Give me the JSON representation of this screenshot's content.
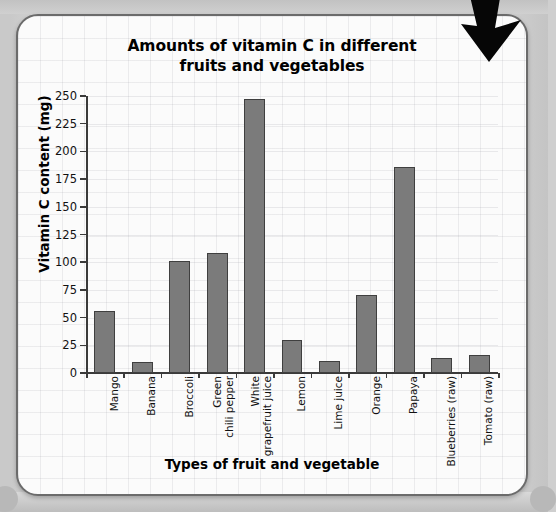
{
  "card": {
    "arrow_icon": "arrow-down-right-icon"
  },
  "chart_data": {
    "type": "bar",
    "title": "Amounts of vitamin C in different fruits and vegetables",
    "title_line1": "Amounts of vitamin C in different",
    "title_line2": "fruits and vegetables",
    "xlabel": "Types of fruit and vegetable",
    "ylabel": "Vitamin C content (mg)",
    "ylim": [
      0,
      250
    ],
    "ytick_step": 25,
    "yticks": [
      0,
      25,
      50,
      75,
      100,
      125,
      150,
      175,
      200,
      225,
      250
    ],
    "ytick_labels": [
      "0",
      "25",
      "50",
      "75",
      "100",
      "125",
      "150",
      "175",
      "200",
      "225",
      "250"
    ],
    "grid": true,
    "legend": "none",
    "bar_color": "#7b7b7b",
    "bar_edge_color": "#3f3f3f",
    "categories": [
      "Mango",
      "Banana",
      "Broccoli",
      "Green chili pepper",
      "White grapefruit juice",
      "Lemon",
      "Lime juice",
      "Orange",
      "Papaya",
      "Blueberries (raw)",
      "Tomato (raw)"
    ],
    "category_lines": [
      [
        "Mango"
      ],
      [
        "Banana"
      ],
      [
        "Broccoli"
      ],
      [
        "Green",
        "chili pepper"
      ],
      [
        "White",
        "grapefruit juice"
      ],
      [
        "Lemon"
      ],
      [
        "Lime juice"
      ],
      [
        "Orange"
      ],
      [
        "Papaya"
      ],
      [
        "Blueberries (raw)"
      ],
      [
        "Tomato (raw)"
      ]
    ],
    "values": [
      56,
      10,
      101,
      108,
      247,
      30,
      11,
      70,
      186,
      14,
      16
    ]
  }
}
